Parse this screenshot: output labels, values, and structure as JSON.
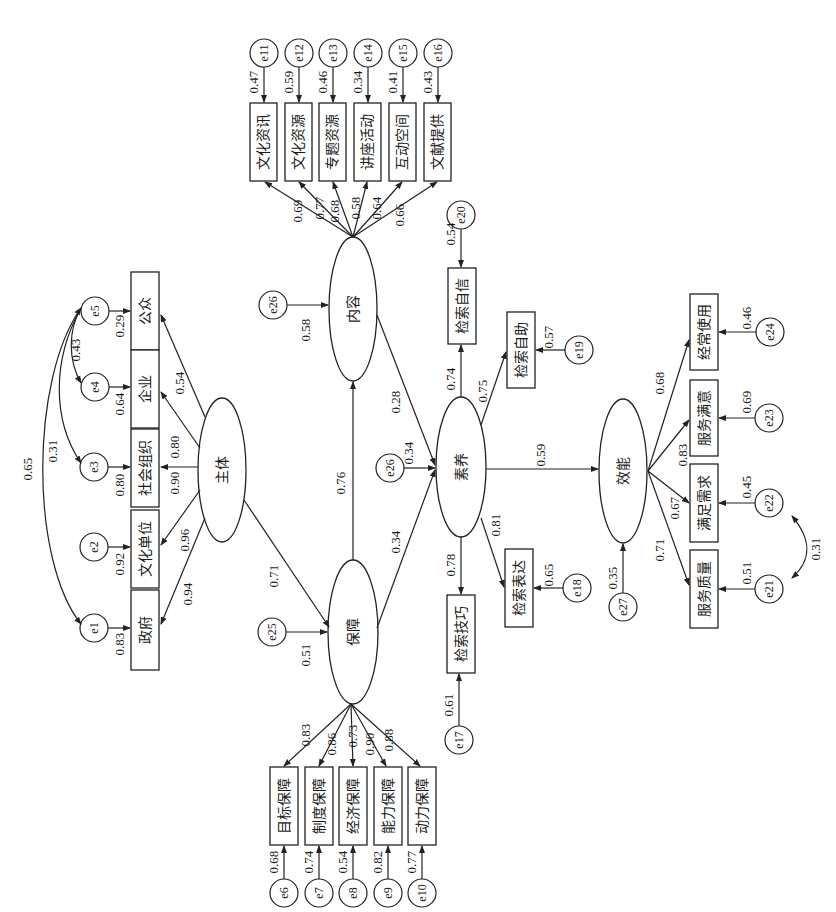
{
  "diagram": {
    "type": "structural-equation-model",
    "orientation": "rotated-90-ccw",
    "latent": {
      "zhuti": "主体",
      "neirong": "内容",
      "baozhang": "保障",
      "suyang": "素养",
      "xiaoneng": "效能"
    },
    "zhuti_indicators": [
      {
        "label": "政府",
        "loading": "0.94",
        "error": "e1",
        "error_value": "0.83"
      },
      {
        "label": "文化单位",
        "loading": "0.96",
        "error": "e2",
        "error_value": "0.92"
      },
      {
        "label": "社会组织",
        "loading": "0.90",
        "error": "e3",
        "error_value": "0.80"
      },
      {
        "label": "企业",
        "loading": "0.80",
        "error": "e4",
        "error_value": "0.64"
      },
      {
        "label": "公众",
        "loading": "0.54",
        "error": "e5",
        "error_value": "0.29"
      }
    ],
    "zhuti_covariances": [
      {
        "from": "e1",
        "to": "e5",
        "value": "0.65"
      },
      {
        "from": "e3",
        "to": "e5",
        "value": "0.31"
      },
      {
        "from": "e4",
        "to": "e5",
        "value": "0.43"
      }
    ],
    "neirong_indicators": [
      {
        "label": "文化资讯",
        "loading": "0.69",
        "error": "e11",
        "error_value": "0.47"
      },
      {
        "label": "文化资源",
        "loading": "0.77",
        "error": "e12",
        "error_value": "0.59"
      },
      {
        "label": "专题资源",
        "loading": "0.68",
        "error": "e13",
        "error_value": "0.46"
      },
      {
        "label": "讲座活动",
        "loading": "0.58",
        "error": "e14",
        "error_value": "0.34"
      },
      {
        "label": "互动空间",
        "loading": "0.64",
        "error": "e15",
        "error_value": "0.41"
      },
      {
        "label": "文献提供",
        "loading": "0.66",
        "error": "e16",
        "error_value": "0.43"
      }
    ],
    "baozhang_indicators": [
      {
        "label": "目标保障",
        "loading": "0.83",
        "error": "e6",
        "error_value": "0.68"
      },
      {
        "label": "制度保障",
        "loading": "0.86",
        "error": "e7",
        "error_value": "0.74"
      },
      {
        "label": "经济保障",
        "loading": "0.73",
        "error": "e8",
        "error_value": "0.54"
      },
      {
        "label": "能力保障",
        "loading": "0.90",
        "error": "e9",
        "error_value": "0.82"
      },
      {
        "label": "动力保障",
        "loading": "0.88",
        "error": "e10",
        "error_value": "0.77"
      }
    ],
    "suyang_indicators": [
      {
        "label": "检索技巧",
        "loading": "0.78",
        "error": "e17",
        "error_value": "0.61"
      },
      {
        "label": "检索表达",
        "loading": "0.81",
        "error": "e18",
        "error_value": "0.65"
      },
      {
        "label": "检索自助",
        "loading": "0.75",
        "error": "e19",
        "error_value": "0.57"
      },
      {
        "label": "检索自信",
        "loading": "0.74",
        "error": "e20",
        "error_value": "0.54"
      }
    ],
    "xiaoneng_indicators": [
      {
        "label": "服务质量",
        "loading": "0.71",
        "error": "e21",
        "error_value": "0.51"
      },
      {
        "label": "满足需求",
        "loading": "0.67",
        "error": "e22",
        "error_value": "0.45"
      },
      {
        "label": "服务满意",
        "loading": "0.83",
        "error": "e23",
        "error_value": "0.69"
      },
      {
        "label": "经常使用",
        "loading": "0.68",
        "error": "e24",
        "error_value": "0.46"
      }
    ],
    "xiaoneng_covariance": {
      "from": "e21",
      "to": "e22",
      "value": "0.31"
    },
    "structural_paths": [
      {
        "from": "主体",
        "to": "保障",
        "value": "0.71"
      },
      {
        "from": "保障",
        "to": "内容",
        "value": "0.76"
      },
      {
        "from": "保障",
        "to": "素养",
        "value": "0.34"
      },
      {
        "from": "内容",
        "to": "素养",
        "value": "0.28"
      },
      {
        "from": "素养",
        "to": "效能",
        "value": "0.59"
      }
    ],
    "latent_errors": [
      {
        "name": "e25",
        "target": "保障",
        "value": "0.51"
      },
      {
        "name": "e26",
        "target": "内容",
        "value": "0.58"
      },
      {
        "name": "e26",
        "target": "素养",
        "value": "0.34"
      },
      {
        "name": "e27",
        "target": "效能",
        "value": "0.35"
      }
    ]
  }
}
